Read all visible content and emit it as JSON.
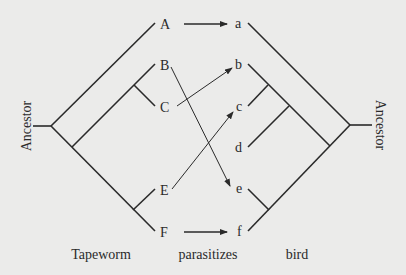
{
  "diagram": {
    "colors": {
      "background": "#ebebea",
      "line": "#2a2a2a"
    },
    "left_tree": {
      "root_label": "Ancestor",
      "tips": [
        "A",
        "B",
        "C",
        "E",
        "F"
      ],
      "group_label": "Tapeworm"
    },
    "right_tree": {
      "root_label": "Ancestor",
      "tips": [
        "a",
        "b",
        "c",
        "d",
        "e",
        "f"
      ],
      "group_label": "bird"
    },
    "relation_label": "parasitizes",
    "associations": [
      {
        "from": "A",
        "to": "a"
      },
      {
        "from": "B",
        "to": "e"
      },
      {
        "from": "C",
        "to": "b"
      },
      {
        "from": "E",
        "to": "c"
      },
      {
        "from": "F",
        "to": "f"
      }
    ]
  }
}
